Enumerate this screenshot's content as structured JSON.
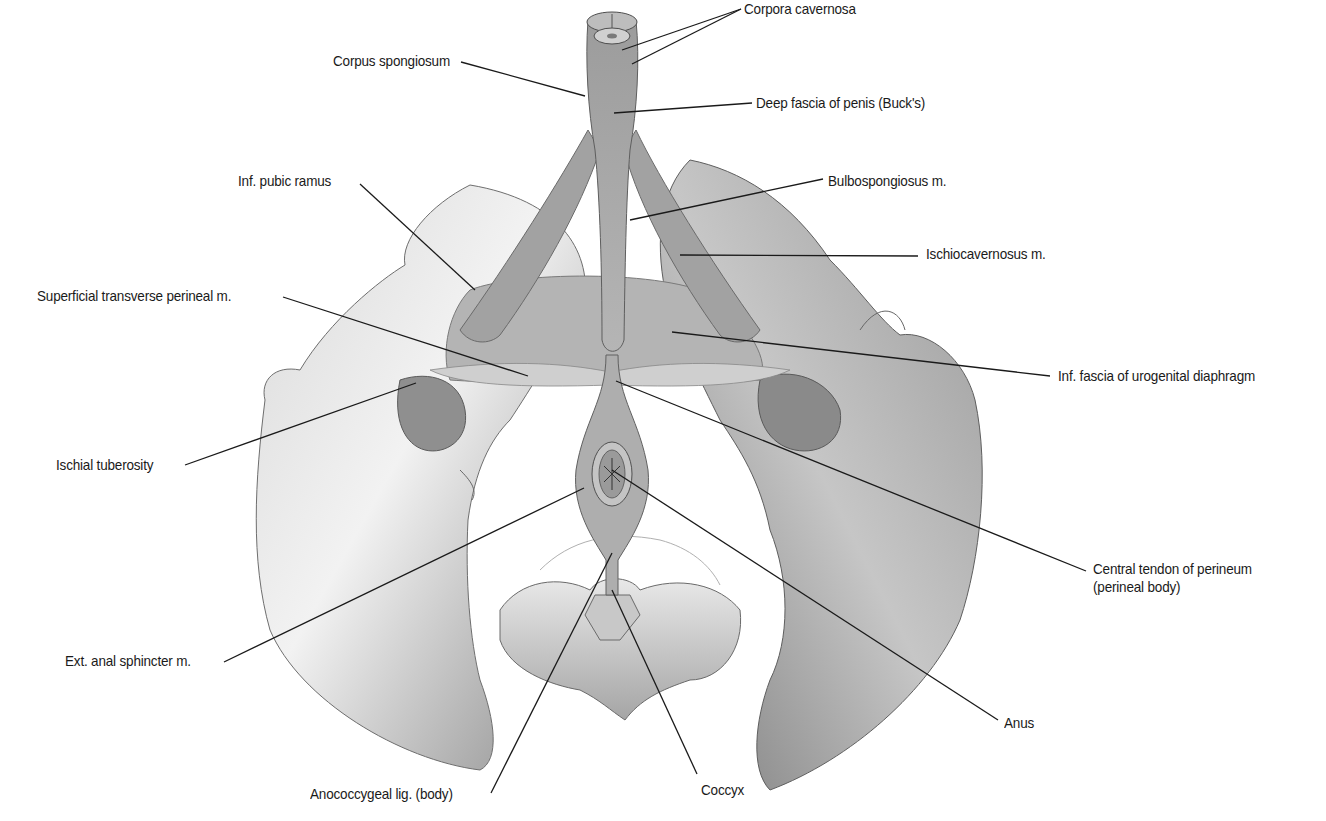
{
  "figure": {
    "background": "#ffffff",
    "colors": {
      "bone_light": "#e6e6e6",
      "bone_mid": "#b8b8b8",
      "bone_dark": "#7d7d7d",
      "muscle": "#a9a9a9",
      "muscle_dark": "#8a8a8a",
      "leader_line": "#1a1a1a",
      "text": "#1a1a1a"
    }
  },
  "labels": [
    {
      "id": "corpora-cavernosa",
      "text": "Corpora cavernosa",
      "x": 744,
      "y": 0,
      "anchor": "left",
      "leaders": [
        [
          741,
          9,
          622,
          50
        ],
        [
          741,
          9,
          632,
          64
        ]
      ]
    },
    {
      "id": "corpus-spongiosum",
      "text": "Corpus spongiosum",
      "x": 333,
      "y": 52,
      "anchor": "left",
      "leaders": [
        [
          461,
          62,
          585,
          96
        ]
      ]
    },
    {
      "id": "deep-fascia-of-penis",
      "text": "Deep fascia of penis (Buck's)",
      "x": 756,
      "y": 94,
      "anchor": "left",
      "leaders": [
        [
          752,
          103,
          614,
          113
        ]
      ]
    },
    {
      "id": "inf-pubic-ramus",
      "text": "Inf. pubic ramus",
      "x": 238,
      "y": 172,
      "anchor": "left",
      "leaders": [
        [
          360,
          184,
          475,
          290
        ]
      ]
    },
    {
      "id": "bulbospongiosus",
      "text": "Bulbospongiosus m.",
      "x": 828,
      "y": 172,
      "anchor": "left",
      "leaders": [
        [
          823,
          179,
          630,
          220
        ]
      ]
    },
    {
      "id": "ischiocavernosus",
      "text": "Ischiocavernosus m.",
      "x": 926,
      "y": 245,
      "anchor": "left",
      "leaders": [
        [
          918,
          256,
          680,
          255
        ]
      ]
    },
    {
      "id": "superficial-transverse-perineal",
      "text": "Superficial transverse perineal m.",
      "x": 37,
      "y": 287,
      "anchor": "left",
      "leaders": [
        [
          283,
          297,
          528,
          376
        ]
      ]
    },
    {
      "id": "inf-fascia-urogenital-diaphragm",
      "text": "Inf. fascia of urogenital diaphragm",
      "x": 1058,
      "y": 367,
      "anchor": "left",
      "leaders": [
        [
          1050,
          376,
          672,
          332
        ]
      ]
    },
    {
      "id": "ischial-tuberosity",
      "text": "Ischial tuberosity",
      "x": 56,
      "y": 456,
      "anchor": "left",
      "leaders": [
        [
          185,
          465,
          416,
          383
        ]
      ]
    },
    {
      "id": "central-tendon-of-perineum",
      "text": "Central tendon of perineum",
      "x": 1093,
      "y": 560,
      "anchor": "left",
      "line2": "(perineal body)",
      "leaders": [
        [
          1086,
          571,
          616,
          381
        ]
      ]
    },
    {
      "id": "ext-anal-sphincter",
      "text": "Ext. anal sphincter m.",
      "x": 65,
      "y": 652,
      "anchor": "left",
      "leaders": [
        [
          224,
          662,
          584,
          488
        ]
      ]
    },
    {
      "id": "anus",
      "text": "Anus",
      "x": 1004,
      "y": 714,
      "anchor": "left",
      "leaders": [
        [
          998,
          720,
          612,
          470
        ]
      ]
    },
    {
      "id": "anococcygeal-lig",
      "text": "Anococcygeal lig. (body)",
      "x": 310,
      "y": 785,
      "anchor": "left",
      "leaders": [
        [
          491,
          793,
          612,
          553
        ]
      ]
    },
    {
      "id": "coccyx",
      "text": "Coccyx",
      "x": 701,
      "y": 781,
      "anchor": "left",
      "leaders": [
        [
          697,
          774,
          612,
          590
        ]
      ]
    }
  ]
}
